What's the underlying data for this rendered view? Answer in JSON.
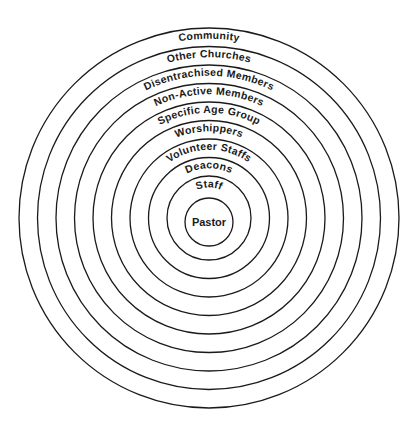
{
  "diagram": {
    "type": "concentric-circles",
    "center_label": "Pastor",
    "rings_outer_to_inner": [
      "Community",
      "Other Churches",
      "Disentrachised Members",
      "Non-Active Members",
      "Specific Age Group",
      "Worshippers",
      "Volunteer Staffs",
      "Deacons",
      "Staff"
    ],
    "labels": {
      "community": "Community",
      "other_churches": "Other Churches",
      "disenfranchised": "Disentrachised Members",
      "non_active": "Non-Active Members",
      "age_group": "Specific Age Group",
      "worshippers": "Worshippers",
      "volunteer": "Volunteer Staffs",
      "deacons": "Deacons",
      "staff": "Staff",
      "pastor": "Pastor"
    },
    "stroke_color": "#1a1a1a",
    "background": "#ffffff"
  }
}
